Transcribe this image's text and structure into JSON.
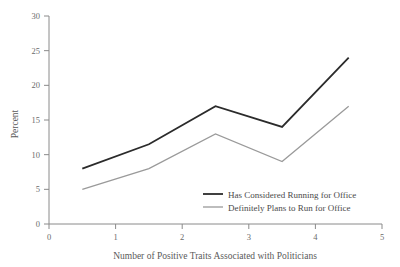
{
  "chart_data": {
    "type": "line",
    "title": "",
    "xlabel": "Number of Positive Traits Associated with Politicians",
    "ylabel": "Percent",
    "xlim": [
      0,
      5
    ],
    "ylim": [
      0,
      30
    ],
    "xticks": [
      "0",
      "1",
      "2",
      "3",
      "4",
      "5"
    ],
    "xtick_values": [
      0,
      1,
      2,
      3,
      4,
      5
    ],
    "yticks": [
      "0",
      "5",
      "10",
      "15",
      "20",
      "25",
      "30"
    ],
    "ytick_values": [
      0,
      5,
      10,
      15,
      20,
      25,
      30
    ],
    "x": [
      0.5,
      1.5,
      2.5,
      3.5,
      4.5
    ],
    "grid": false,
    "legend_position": "inside-lower-right",
    "series": [
      {
        "name": "Has Considered Running for Office",
        "values": [
          8,
          11.5,
          17,
          14,
          24
        ],
        "color": "#2b2b2b",
        "width": 1.8
      },
      {
        "name": "Definitely Plans to Run for Office",
        "values": [
          5,
          8,
          13,
          9,
          17
        ],
        "color": "#9a9a9a",
        "width": 1.3
      }
    ]
  },
  "axes": {
    "y_label": "Percent",
    "x_label": "Number of Positive Traits Associated with Politicians",
    "axis_color": "#8a8a8a"
  },
  "legend": {
    "items": [
      {
        "label": "Has Considered Running for Office",
        "color": "#2b2b2b"
      },
      {
        "label": "Definitely Plans to Run for Office",
        "color": "#9a9a9a"
      }
    ]
  }
}
